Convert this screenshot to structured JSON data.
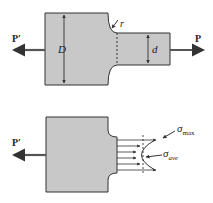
{
  "figure": {
    "top": {
      "load_left": "P′",
      "load_right": "P",
      "dim_large": "D",
      "dim_small": "d",
      "fillet_radius": "r"
    },
    "bottom": {
      "load_left": "P′",
      "sigma_max": {
        "symbol": "σ",
        "subscript": "max"
      },
      "sigma_ave": {
        "symbol": "σ",
        "subscript": "ave"
      }
    },
    "colors": {
      "fill": "#c8c8c8",
      "stroke": "#333333",
      "arrow": "#555555"
    }
  }
}
